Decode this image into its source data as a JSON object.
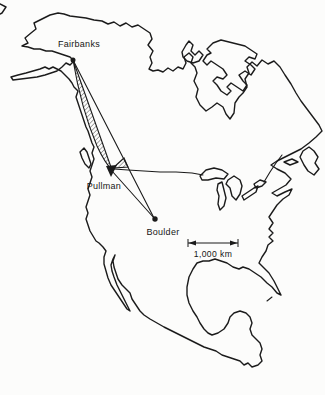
{
  "colors": {
    "ink": "#1b1b1b",
    "paper": "#fcfcfb"
  },
  "map": {
    "locations": [
      {
        "name": "Fairbanks",
        "marker": "filled-dot"
      },
      {
        "name": "Pullman",
        "marker": "down-arrowhead"
      },
      {
        "name": "Boulder",
        "marker": "filled-dot"
      }
    ],
    "scale_bar": {
      "label": "1,000 km"
    }
  }
}
